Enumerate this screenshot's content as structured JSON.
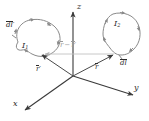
{
  "figure": {
    "type": "vector-diagram",
    "background_color": "#ffffff",
    "line_color": "#7a7a7a",
    "axis_color": "#4a4a4a",
    "faint_color": "#b9b9b9",
    "text_color": "#2b2b2b"
  },
  "axes": {
    "z": {
      "label": "z",
      "direction": "up"
    },
    "y": {
      "label": "y",
      "direction": "right-down"
    },
    "x": {
      "label": "x",
      "direction": "left-down"
    },
    "origin": {
      "x": 73,
      "y": 76
    }
  },
  "loops": [
    {
      "name": "loop-1",
      "current_label": "I",
      "current_subscript": "1",
      "element_label": "dl",
      "element_prime": "′",
      "position": "upper-left"
    },
    {
      "name": "loop-2",
      "current_label": "I",
      "current_subscript": "2",
      "element_label": "dl",
      "element_prime": "",
      "position": "upper-right"
    }
  ],
  "vectors": [
    {
      "name": "r-prime-vector",
      "label": "r",
      "prime": "′",
      "from": "origin",
      "to": "loop-1",
      "color": "#4a4a4a"
    },
    {
      "name": "r-vector",
      "label": "r",
      "prime": "",
      "from": "origin",
      "to": "loop-2",
      "color": "#4a4a4a"
    },
    {
      "name": "separation-vector",
      "label_left": "r",
      "label_minus": "−",
      "label_right": "r",
      "prime_right": "′",
      "from": "loop-2",
      "to": "loop-1",
      "color": "#b9b9b9"
    }
  ],
  "labels": {
    "dl_prime": "dl",
    "dl": "dl",
    "I1": "I",
    "I1_sub": "1",
    "I2": "I",
    "I2_sub": "2",
    "r_prime": "r",
    "r": "r",
    "sep_minus": "−",
    "x_axis": "x",
    "y_axis": "y",
    "z_axis": "z",
    "prime_mark": "′"
  }
}
